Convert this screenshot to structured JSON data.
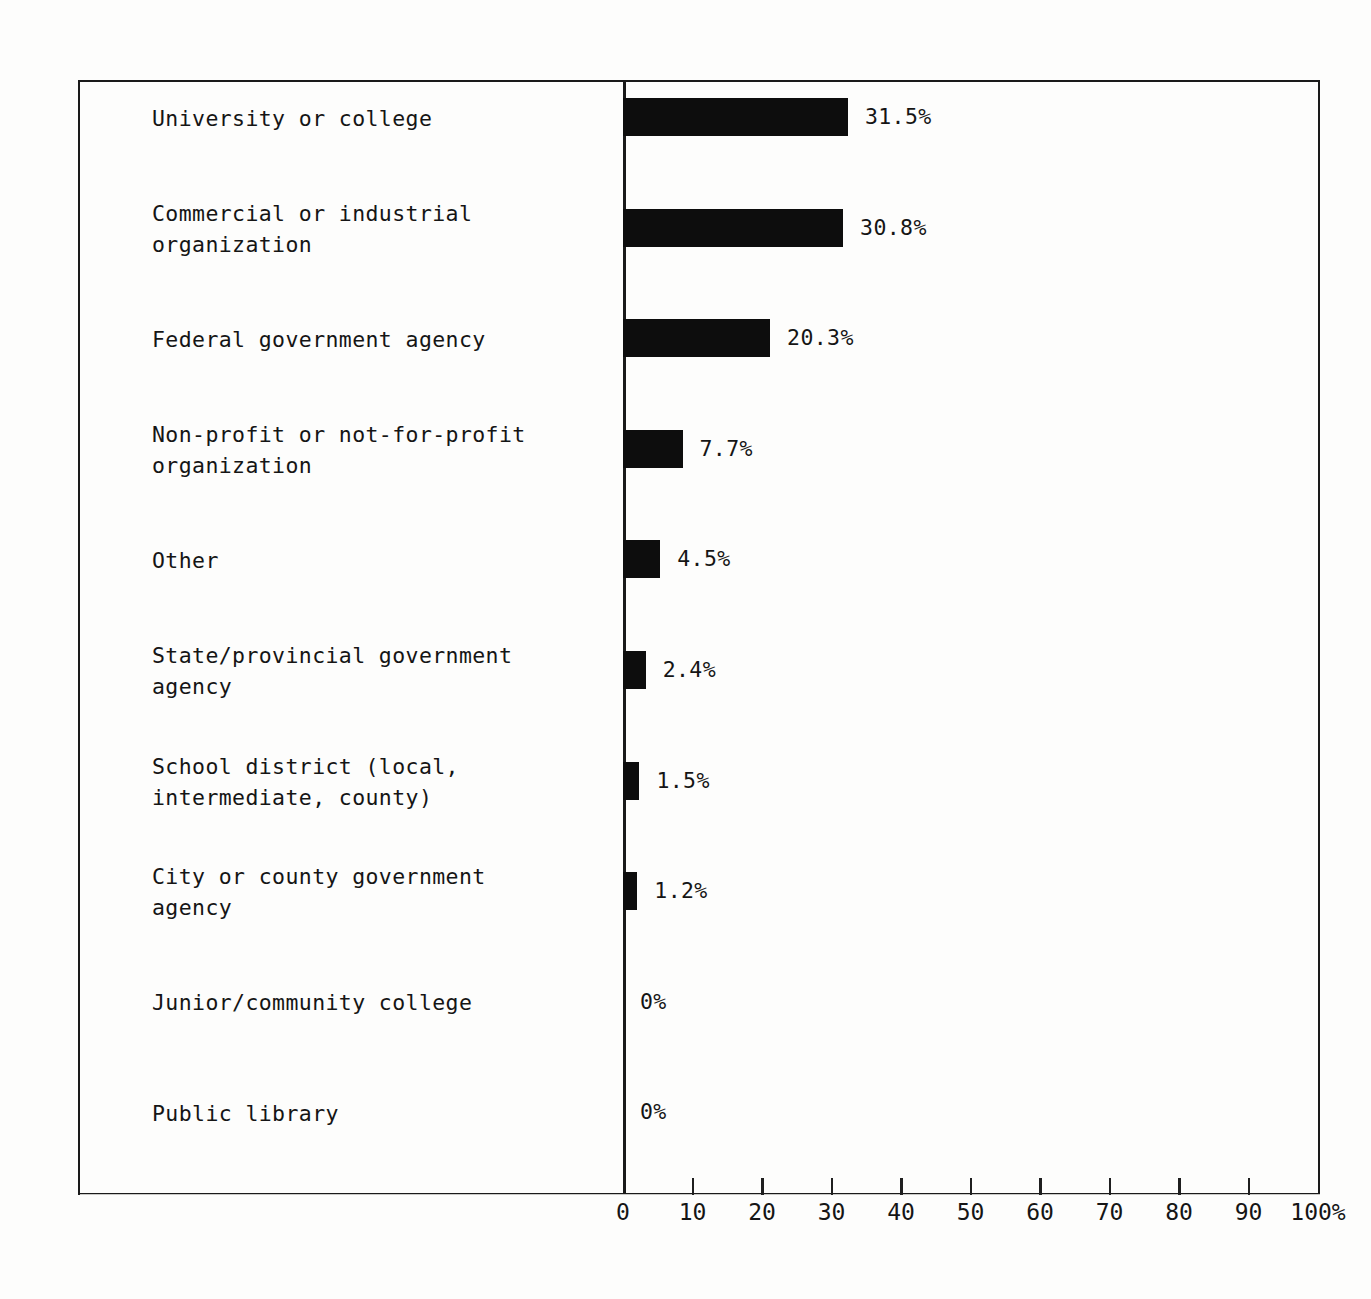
{
  "chart_data": {
    "type": "bar",
    "orientation": "horizontal",
    "title": "",
    "subtitle": "",
    "xlabel": "",
    "ylabel": "",
    "xlim": [
      0,
      100
    ],
    "grid": false,
    "legend": null,
    "axis_tick_labels": [
      "0",
      "10",
      "20",
      "30",
      "40",
      "50",
      "60",
      "70",
      "80",
      "90",
      "100%"
    ],
    "axis_ticks": [
      0,
      10,
      20,
      30,
      40,
      50,
      60,
      70,
      80,
      90,
      100
    ],
    "value_label_suffix": "%",
    "categories": [
      "University or college",
      "Commercial or industrial\norganization",
      "Federal government agency",
      "Non-profit or not-for-profit\norganization",
      "Other",
      "State/provincial government\nagency",
      "School district (local,\nintermediate, county)",
      "City or county government\nagency",
      "Junior/community college",
      "Public library"
    ],
    "values": [
      31.5,
      30.8,
      20.3,
      7.7,
      4.5,
      2.4,
      1.5,
      1.2,
      0,
      0
    ],
    "value_labels": [
      "31.5%",
      "30.8%",
      "20.3%",
      "7.7%",
      "4.5%",
      "2.4%",
      "1.5%",
      "1.2%",
      "0%",
      "0%"
    ]
  },
  "rows": [
    {
      "label": "University or college",
      "value": 31.5,
      "value_label": "31.5%"
    },
    {
      "label": "Commercial or industrial\norganization",
      "value": 30.8,
      "value_label": "30.8%"
    },
    {
      "label": "Federal government agency",
      "value": 20.3,
      "value_label": "20.3%"
    },
    {
      "label": "Non-profit or not-for-profit\norganization",
      "value": 7.7,
      "value_label": "7.7%"
    },
    {
      "label": "Other",
      "value": 4.5,
      "value_label": "4.5%"
    },
    {
      "label": "State/provincial government\nagency",
      "value": 2.4,
      "value_label": "2.4%"
    },
    {
      "label": "School district (local,\nintermediate, county)",
      "value": 1.5,
      "value_label": "1.5%"
    },
    {
      "label": "City or county government\nagency",
      "value": 1.2,
      "value_label": "1.2%"
    },
    {
      "label": "Junior/community college",
      "value": 0,
      "value_label": "0%"
    },
    {
      "label": "Public library",
      "value": 0,
      "value_label": "0%"
    }
  ],
  "axis": {
    "ticks": [
      {
        "value": 0,
        "label": "0"
      },
      {
        "value": 10,
        "label": "10"
      },
      {
        "value": 20,
        "label": "20"
      },
      {
        "value": 30,
        "label": "30"
      },
      {
        "value": 40,
        "label": "40"
      },
      {
        "value": 50,
        "label": "50"
      },
      {
        "value": 60,
        "label": "60"
      },
      {
        "value": 70,
        "label": "70"
      },
      {
        "value": 80,
        "label": "80"
      },
      {
        "value": 90,
        "label": "90"
      },
      {
        "value": 100,
        "label": "100%"
      }
    ]
  },
  "colors": {
    "bar": "#0d0d0d",
    "frame": "#1a1a1a",
    "text": "#151515",
    "background": "#fdfdfc"
  }
}
